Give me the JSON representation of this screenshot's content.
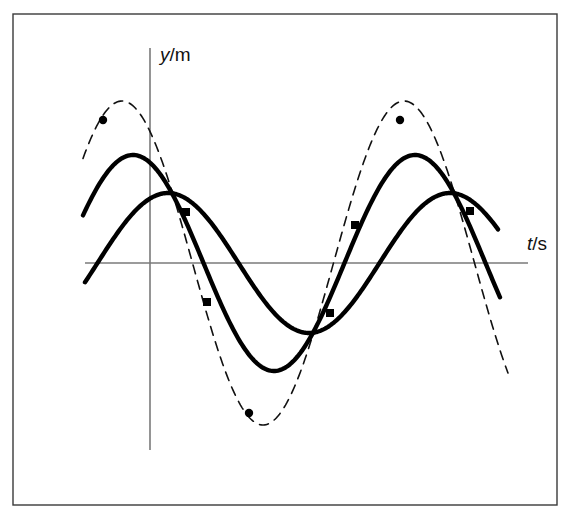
{
  "figure": {
    "kind": "line-plot",
    "background_color": "#ffffff",
    "ink_color": "#000000",
    "frame": {
      "label": "outer-border",
      "x": 13,
      "y": 14,
      "width": 544,
      "height": 491,
      "stroke": "#3a3a3a",
      "stroke_width": 1.4
    },
    "axes": {
      "origin_x": 150,
      "origin_y": 263,
      "vertical": {
        "x": 150,
        "y_top": 48,
        "y_bottom": 450,
        "stroke": "#7a7a7a",
        "stroke_width": 1.6
      },
      "horizontal": {
        "y": 263,
        "x_left": 85,
        "x_right": 528,
        "stroke": "#7a7a7a",
        "stroke_width": 1.6
      },
      "y_axis_label": {
        "variable": "y",
        "separator": "/",
        "unit": "m",
        "text": "y/m",
        "x": 160,
        "y": 61
      },
      "x_axis_label": {
        "variable": "t",
        "separator": "/",
        "unit": "s",
        "text": "t/s",
        "x": 527,
        "y": 250
      }
    }
  },
  "chart_data": {
    "type": "line",
    "title": "",
    "subtitle": "",
    "xlabel": "t/s",
    "ylabel": "y/m",
    "grid": false,
    "legend": false,
    "axis_ticks": {
      "x": [],
      "y": []
    },
    "xlim": [
      85,
      528
    ],
    "ylim_pixels": [
      48,
      450
    ],
    "note": "Three superposed sinusoids of equal period drawn in pixel space; y grows upward from the horizontal axis at pixel y=263.",
    "period_px": 282,
    "series": [
      {
        "name": "resultant-wave-dashed",
        "style": "dashed",
        "stroke": "#111111",
        "stroke_width": 1.6,
        "dash_pattern": "9 7",
        "amplitude_px": 162,
        "phase_peak_x": 122,
        "x_start": 83,
        "x_end": 508,
        "markers": "round",
        "marker_points": [
          {
            "x": 103,
            "y": 120,
            "shape": "round"
          },
          {
            "x": 249,
            "y": 413,
            "shape": "round"
          },
          {
            "x": 400,
            "y": 120,
            "shape": "round"
          }
        ]
      },
      {
        "name": "component-wave-1-solid",
        "style": "solid",
        "stroke": "#000000",
        "stroke_width": 4.4,
        "amplitude_px": 108,
        "phase_peak_x": 133,
        "x_start": 83,
        "x_end": 500,
        "markers": "square",
        "marker_points": [
          {
            "x": 186,
            "y": 212,
            "shape": "square"
          },
          {
            "x": 207,
            "y": 302,
            "shape": "square"
          },
          {
            "x": 470,
            "y": 211,
            "shape": "square"
          }
        ]
      },
      {
        "name": "component-wave-2-solid",
        "style": "solid",
        "stroke": "#000000",
        "stroke_width": 4.4,
        "amplitude_px": 70,
        "phase_peak_x": 168,
        "x_start": 85,
        "x_end": 498,
        "markers": "square",
        "marker_points": [
          {
            "x": 330,
            "y": 313,
            "shape": "square"
          },
          {
            "x": 355,
            "y": 225,
            "shape": "square"
          }
        ]
      }
    ]
  }
}
